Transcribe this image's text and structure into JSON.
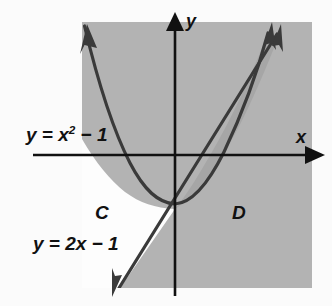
{
  "figure": {
    "kind": "shaded-region-graph",
    "background_color": "#fbfbfb",
    "shade_color": "#b3b3b3",
    "shade_overlap_color": "#a0a0a0",
    "unshaded_color": "#fdfdfd",
    "stroke_color": "#3a3a3a",
    "axis_color": "#111111",
    "plot_rect": {
      "x": 82,
      "y": 22,
      "width": 230,
      "height": 266
    },
    "origin": {
      "x": 175,
      "y": 155
    },
    "axes": {
      "x_label": "x",
      "y_label": "y",
      "x_axis_start_x": 33,
      "x_axis_end_x": 322,
      "y_axis_top_y": 16,
      "y_axis_bottom_y": 296
    },
    "curves": [
      {
        "name": "parabola",
        "equation_label": "y = x",
        "equation_exponent": "2",
        "equation_tail": " − 1",
        "full_text": "y = x² − 1",
        "arrows": [
          "upper-left",
          "upper-right"
        ]
      },
      {
        "name": "line",
        "equation_label": "y = 2x − 1",
        "full_text": "y = 2x − 1",
        "arrows": [
          "lower-left",
          "upper-right"
        ]
      }
    ],
    "regions": [
      {
        "id": "C",
        "label": "C",
        "shaded": false
      },
      {
        "id": "D",
        "label": "D",
        "shaded": true
      }
    ]
  },
  "labels": {
    "axis_x": "x",
    "axis_y": "y",
    "parabola_prefix": "y = x",
    "parabola_exponent": "2",
    "parabola_suffix": " − 1",
    "line": "y = 2x − 1",
    "region_c": "C",
    "region_d": "D"
  }
}
